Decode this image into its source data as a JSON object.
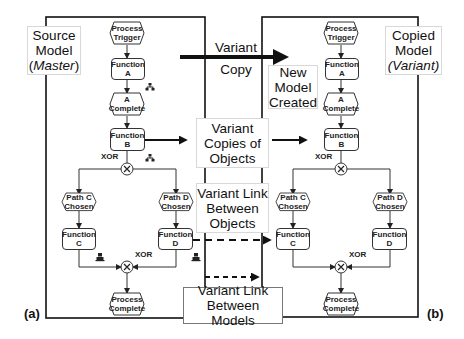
{
  "labels": {
    "source_model": {
      "line1": "Source",
      "line2": "Model",
      "line3": "Master"
    },
    "copied_model": {
      "line1": "Copied",
      "line2": "Model",
      "line3": "Variant"
    },
    "variant_copy": {
      "line1": "Variant",
      "line2": "Copy"
    },
    "new_model": {
      "line1": "New",
      "line2": "Model",
      "line3": "Created"
    },
    "variant_copies_objects": {
      "line1": "Variant",
      "line2": "Copies of",
      "line3": "Objects"
    },
    "variant_link_objects": {
      "line1": "Variant Link",
      "line2": "Between",
      "line3": "Objects"
    },
    "variant_link_models": {
      "line1": "Variant Link",
      "line2": "Between Models"
    },
    "panel_a": "(a)",
    "panel_b": "(b)"
  },
  "nodes": {
    "process_trigger": {
      "l1": "Process",
      "l2": "Trigger"
    },
    "function_a": {
      "l1": "Function",
      "l2": "A"
    },
    "a_complete": {
      "l1": "A",
      "l2": "Complete"
    },
    "function_b": {
      "l1": "Function",
      "l2": "B"
    },
    "path_c": {
      "l1": "Path C",
      "l2": "Chosen"
    },
    "path_d": {
      "l1": "Path D",
      "l2": "Chosen"
    },
    "function_c": {
      "l1": "Function",
      "l2": "C"
    },
    "function_d": {
      "l1": "Function",
      "l2": "D"
    },
    "process_complete": {
      "l1": "Process",
      "l2": "Complete"
    },
    "xor": "XOR"
  }
}
